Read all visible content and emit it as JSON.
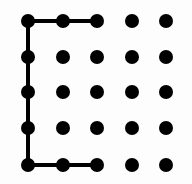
{
  "diagram": {
    "type": "dot-grid-path",
    "grid": {
      "rows": 5,
      "cols": 5,
      "x_positions": [
        28,
        63,
        97,
        132,
        166
      ],
      "y_positions": [
        21,
        57,
        92,
        128,
        165
      ],
      "dot_radius": 7,
      "dot_color": "#000000"
    },
    "path": {
      "stroke_color": "#000000",
      "stroke_width": 4,
      "points": [
        {
          "col": 2,
          "row": 0
        },
        {
          "col": 1,
          "row": 0
        },
        {
          "col": 0,
          "row": 0
        },
        {
          "col": 0,
          "row": 1
        },
        {
          "col": 0,
          "row": 2
        },
        {
          "col": 0,
          "row": 3
        },
        {
          "col": 0,
          "row": 4
        },
        {
          "col": 1,
          "row": 4
        },
        {
          "col": 2,
          "row": 4
        }
      ]
    }
  }
}
